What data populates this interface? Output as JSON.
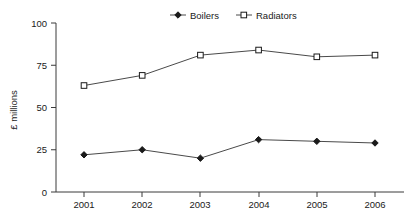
{
  "chart_data": {
    "type": "line",
    "title": "",
    "subtitle": "",
    "xlabel": "",
    "ylabel": "£ millions",
    "categories": [
      "2001",
      "2002",
      "2003",
      "2004",
      "2005",
      "2006"
    ],
    "series": [
      {
        "name": "Boilers",
        "marker": "filled-diamond",
        "color": "#1a1a1a",
        "values": [
          22,
          25,
          20,
          31,
          30,
          29
        ]
      },
      {
        "name": "Radiators",
        "marker": "hollow-square",
        "color": "#1a1a1a",
        "values": [
          63,
          69,
          81,
          84,
          80,
          81
        ]
      }
    ],
    "ylim": [
      0,
      100
    ],
    "yticks": [
      "0",
      "25",
      "50",
      "75",
      "100"
    ],
    "ytick_values": [
      0,
      25,
      50,
      75,
      100
    ],
    "grid": false,
    "legend_position": "top-center"
  },
  "legend": {
    "items": [
      {
        "label": "Boilers"
      },
      {
        "label": "Radiators"
      }
    ]
  },
  "axes": {
    "y_title": "£ millions",
    "y_tick_labels": [
      "100",
      "75",
      "50",
      "25",
      "0"
    ],
    "x_tick_labels": [
      "2001",
      "2002",
      "2003",
      "2004",
      "2005",
      "2006"
    ]
  }
}
